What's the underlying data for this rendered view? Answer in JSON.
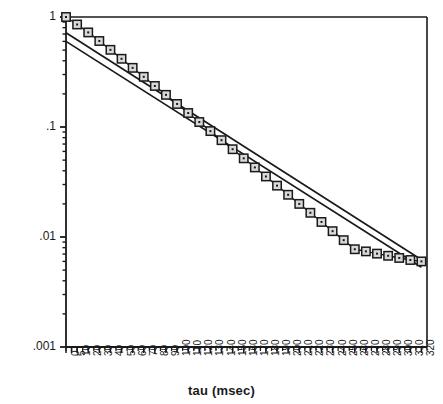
{
  "chart_data": {
    "type": "scatter",
    "title": "",
    "xlabel": "tau (msec)",
    "ylabel": "Echo signal",
    "yscale": "log",
    "xscale": "linear",
    "xlim": [
      0,
      325
    ],
    "ylim": [
      0.001,
      1
    ],
    "grid": false,
    "legend": "none",
    "y_tick_labels": [
      "1",
      ".1",
      ".01",
      ".001"
    ],
    "y_tick_values": [
      1,
      0.1,
      0.01,
      0.001
    ],
    "x_tick_labels": [
      "0",
      "5",
      "10",
      "20",
      "30",
      "40",
      "50",
      "60",
      "70",
      "80",
      "90",
      "100",
      "110",
      "120",
      "130",
      "140",
      "150",
      "160",
      "170",
      "180",
      "190",
      "200",
      "210",
      "220",
      "230",
      "240",
      "250",
      "260",
      "270",
      "280",
      "290",
      "300",
      "310",
      "320"
    ],
    "x_tick_values": [
      0,
      5,
      10,
      20,
      30,
      40,
      50,
      60,
      70,
      80,
      90,
      100,
      110,
      120,
      130,
      140,
      150,
      160,
      170,
      180,
      190,
      200,
      210,
      220,
      230,
      240,
      250,
      260,
      270,
      280,
      290,
      300,
      310,
      320
    ],
    "marker": "open-square-with-center-dot",
    "series": [
      {
        "name": "Echo signal data",
        "marker": "square",
        "x": [
          0,
          10,
          20,
          30,
          40,
          50,
          60,
          70,
          80,
          90,
          100,
          110,
          120,
          130,
          140,
          150,
          160,
          170,
          180,
          190,
          200,
          210,
          220,
          230,
          240,
          250,
          260,
          270,
          280,
          290,
          300,
          310,
          320
        ],
        "y": [
          1.0,
          0.855,
          0.724,
          0.605,
          0.503,
          0.417,
          0.345,
          0.286,
          0.236,
          0.196,
          0.162,
          0.134,
          0.111,
          0.0918,
          0.0759,
          0.0628,
          0.0519,
          0.0429,
          0.0355,
          0.0293,
          0.0242,
          0.02,
          0.0166,
          0.0137,
          0.0113,
          0.00936,
          0.00774,
          0.0074,
          0.00706,
          0.00675,
          0.00645,
          0.00618,
          0.006
        ]
      },
      {
        "name": "fit line upper",
        "marker": "none",
        "x": [
          0,
          320
        ],
        "y": [
          0.72,
          0.0062
        ]
      },
      {
        "name": "fit line lower",
        "marker": "none",
        "x": [
          0,
          320
        ],
        "y": [
          0.6,
          0.0053
        ]
      }
    ],
    "axis_color": "#1a1a1a",
    "marker_face_color": "#d9d9d9",
    "marker_edge_color": "#1a1a1a",
    "line_color": "#1a1a1a"
  }
}
